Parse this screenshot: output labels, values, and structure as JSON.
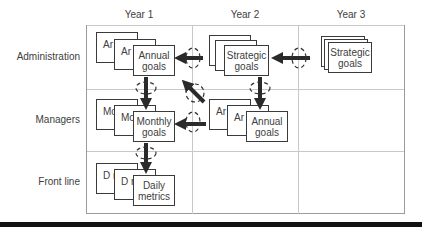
{
  "columns": [
    {
      "label": "Year 1"
    },
    {
      "label": "Year 2"
    },
    {
      "label": "Year 3"
    }
  ],
  "rows": [
    {
      "label": "Administration"
    },
    {
      "label": "Managers"
    },
    {
      "label": "Front line"
    }
  ],
  "cards": {
    "y1_admin": {
      "back1": "Ar gc",
      "back2": "Ar g",
      "front_line1": "Annual",
      "front_line2": "goals"
    },
    "y2_admin": {
      "front_line1": "Strategic",
      "front_line2": "goals"
    },
    "y3_admin": {
      "front_line1": "Strategic",
      "front_line2": "goals"
    },
    "y1_mgr": {
      "back1": "Mc gc",
      "back2": "Mc g",
      "front_line1": "Monthly",
      "front_line2": "goals"
    },
    "y2_mgr": {
      "back1": "Ar g",
      "back2": "Ar g",
      "front_line1": "Annual",
      "front_line2": "goals"
    },
    "y1_front": {
      "back1": "D m",
      "back2": "D m",
      "front_line1": "Daily",
      "front_line2": "metrics"
    }
  },
  "arrows": [
    {
      "from": "Year 2 Strategic goals",
      "to": "Year 1 Annual goals",
      "direction": "left",
      "cycle_icon": true
    },
    {
      "from": "Year 3 Strategic goals",
      "to": "Year 2 Strategic goals",
      "direction": "left",
      "cycle_icon": true
    },
    {
      "from": "Year 1 Annual goals",
      "to": "Year 1 Monthly goals",
      "direction": "down",
      "cycle_icon": true
    },
    {
      "from": "Year 2 Strategic goals",
      "to": "Year 2 Annual goals",
      "direction": "down",
      "cycle_icon": true
    },
    {
      "from": "Year 2 Annual goals",
      "to": "Year 1 Monthly goals",
      "direction": "left",
      "cycle_icon": true
    },
    {
      "from": "Year 2 Annual goals",
      "to": "Year 1 Annual goals",
      "direction": "up-left",
      "cycle_icon": true
    },
    {
      "from": "Year 1 Monthly goals",
      "to": "Year 1 Daily metrics",
      "direction": "down",
      "cycle_icon": true
    }
  ],
  "colors": {
    "grid": "#c8c8c8",
    "card_border": "#3a3a3a",
    "arrow": "#2a2a2a",
    "text": "#404040",
    "rule": "#111111"
  }
}
